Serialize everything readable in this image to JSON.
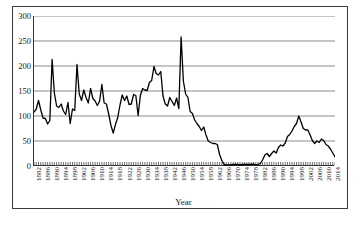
{
  "chart_data": {
    "type": "line",
    "title": "",
    "xlabel": "Year",
    "ylabel": "",
    "ylim": [
      0,
      300
    ],
    "xlim": [
      1882,
      2015
    ],
    "yticks": [
      0,
      50,
      100,
      150,
      200,
      250,
      300
    ],
    "xticks": [
      1882,
      1886,
      1890,
      1894,
      1898,
      1902,
      1906,
      1910,
      1914,
      1918,
      1922,
      1926,
      1930,
      1934,
      1938,
      1942,
      1946,
      1950,
      1954,
      1958,
      1962,
      1966,
      1970,
      1974,
      1978,
      1982,
      1986,
      1990,
      1994,
      1998,
      2002,
      2006,
      2010,
      2014
    ],
    "grid": "horizontal",
    "legend": "none",
    "line_color": "#000000",
    "series": [
      {
        "name": "value",
        "x": [
          1882,
          1883,
          1884,
          1885,
          1886,
          1887,
          1888,
          1889,
          1890,
          1891,
          1892,
          1893,
          1894,
          1895,
          1896,
          1897,
          1898,
          1899,
          1900,
          1901,
          1902,
          1903,
          1904,
          1905,
          1906,
          1907,
          1908,
          1909,
          1910,
          1911,
          1912,
          1913,
          1914,
          1915,
          1916,
          1917,
          1918,
          1919,
          1920,
          1921,
          1922,
          1923,
          1924,
          1925,
          1926,
          1927,
          1928,
          1929,
          1930,
          1931,
          1932,
          1933,
          1934,
          1935,
          1936,
          1937,
          1938,
          1939,
          1940,
          1941,
          1942,
          1943,
          1944,
          1945,
          1946,
          1947,
          1948,
          1949,
          1950,
          1951,
          1952,
          1953,
          1954,
          1955,
          1956,
          1957,
          1958,
          1959,
          1960,
          1961,
          1962,
          1963,
          1964,
          1965,
          1966,
          1967,
          1968,
          1969,
          1970,
          1971,
          1972,
          1973,
          1974,
          1975,
          1976,
          1977,
          1978,
          1979,
          1980,
          1981,
          1982,
          1983,
          1984,
          1985,
          1986,
          1987,
          1988,
          1989,
          1990,
          1991,
          1992,
          1993,
          1994,
          1995,
          1996,
          1997,
          1998,
          1999,
          2000,
          2001,
          2002,
          2003,
          2004,
          2005,
          2006,
          2007,
          2008,
          2009,
          2010,
          2011,
          2012,
          2013,
          2014,
          2015
        ],
        "values": [
          108,
          114,
          131,
          112,
          96,
          95,
          84,
          91,
          213,
          146,
          120,
          117,
          124,
          110,
          103,
          127,
          85,
          114,
          111,
          203,
          144,
          131,
          152,
          137,
          126,
          155,
          135,
          130,
          121,
          130,
          163,
          126,
          124,
          104,
          81,
          66,
          83,
          97,
          122,
          142,
          131,
          140,
          123,
          124,
          143,
          141,
          101,
          141,
          155,
          152,
          151,
          167,
          171,
          199,
          185,
          182,
          189,
          140,
          124,
          120,
          137,
          129,
          121,
          136,
          115,
          258,
          170,
          144,
          137,
          109,
          105,
          92,
          85,
          79,
          71,
          78,
          62,
          50,
          47,
          45,
          45,
          43,
          23,
          11,
          3,
          2,
          2,
          2,
          3,
          3,
          3,
          2,
          3,
          3,
          3,
          3,
          3,
          4,
          2,
          3,
          5,
          12,
          22,
          25,
          19,
          25,
          30,
          26,
          37,
          42,
          40,
          46,
          59,
          63,
          70,
          79,
          85,
          100,
          88,
          75,
          72,
          72,
          62,
          51,
          45,
          50,
          47,
          54,
          51,
          43,
          40,
          34,
          26,
          18
        ]
      }
    ]
  },
  "axis": {
    "x_title": "Year"
  }
}
